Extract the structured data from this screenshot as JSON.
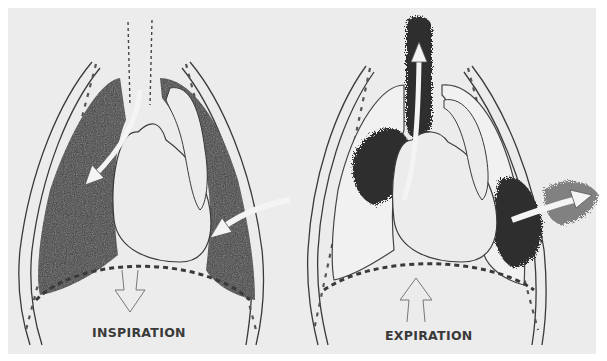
{
  "diagram": {
    "panels": [
      {
        "id": "inspiration",
        "label": "INSPIRATION",
        "airflow_arrows": [
          "trachea-into-left-lung",
          "chest-wall-into-right-pleura"
        ],
        "diaphragm_arrow": "down",
        "lungs_state": "inflated-dark"
      },
      {
        "id": "expiration",
        "label": "EXPIRATION",
        "airflow_arrows": [
          "up-trachea",
          "out-chest-wall"
        ],
        "diaphragm_arrow": "up",
        "lungs_state": "collapsed-partial-dark"
      }
    ]
  },
  "colors": {
    "page_background": "#ffffff",
    "panel_background": "#ececec",
    "ink": "#2b2b2b",
    "stipple": "#3a3a3a",
    "light_fill": "#eeeeee"
  }
}
